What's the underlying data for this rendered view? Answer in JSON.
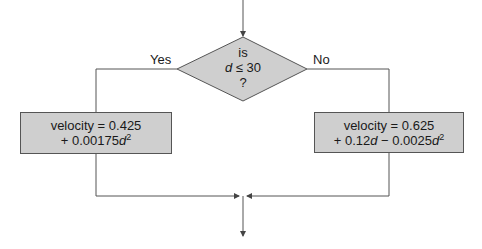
{
  "diagram": {
    "type": "flowchart",
    "decision": {
      "line1": "is",
      "line2_var": "d",
      "line2_rest": " ≤ 30",
      "line3": "?"
    },
    "branches": {
      "yes_label": "Yes",
      "no_label": "No"
    },
    "yes_box": {
      "line1": "velocity = 0.425",
      "line2_pre": "+ 0.00175",
      "line2_var": "d",
      "line2_exp": "2"
    },
    "no_box": {
      "line1": "velocity = 0.625",
      "line2_pre": "+ 0.12",
      "line2_var1": "d",
      "line2_mid": " − 0.0025",
      "line2_var2": "d",
      "line2_exp": "2"
    },
    "colors": {
      "box_fill": "#cfcfcf",
      "line": "#555555"
    }
  }
}
